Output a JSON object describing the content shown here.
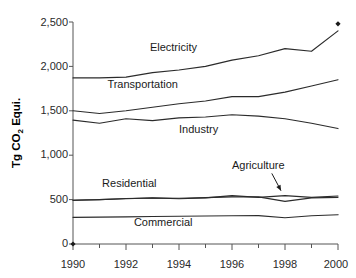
{
  "chart_data": {
    "type": "line",
    "title": "",
    "subtitle": "",
    "xlabel": "",
    "ylabel": "Tg CO2 Equi.",
    "ylabel_parts": {
      "pre": "Tg CO",
      "sub": "2",
      "post": " Equi."
    },
    "xlim": [
      1990,
      2000
    ],
    "ylim": [
      0,
      2500
    ],
    "grid": false,
    "legend_position": "inline-labels",
    "y_ticks": [
      0,
      500,
      1000,
      1500,
      2000,
      2500
    ],
    "y_tick_labels": [
      "0",
      "500",
      "1,000",
      "1,500",
      "2,000",
      "2,500"
    ],
    "x_ticks": [
      1990,
      1992,
      1994,
      1996,
      1998,
      2000
    ],
    "x_tick_labels": [
      "1990",
      "1992",
      "1994",
      "1996",
      "1998",
      "2000"
    ],
    "x_minor_ticks": [
      1991,
      1993,
      1995,
      1997,
      1999
    ],
    "x": [
      1990,
      1991,
      1992,
      1993,
      1994,
      1995,
      1996,
      1997,
      1998,
      1999,
      2000
    ],
    "series": [
      {
        "name": "Electricity",
        "label": "Electricity",
        "values": [
          1870,
          1870,
          1880,
          1930,
          1960,
          2000,
          2070,
          2120,
          2200,
          2170,
          2400
        ],
        "label_x": 1992.9,
        "label_y": 2170
      },
      {
        "name": "Transportation",
        "label": "Transportation",
        "values": [
          1500,
          1470,
          1500,
          1540,
          1580,
          1610,
          1660,
          1660,
          1710,
          1780,
          1850
        ],
        "label_x": 1991.3,
        "label_y": 1760
      },
      {
        "name": "Industry",
        "label": "Industry",
        "values": [
          1395,
          1360,
          1410,
          1390,
          1420,
          1430,
          1455,
          1440,
          1410,
          1360,
          1300
        ],
        "label_x": 1994.0,
        "label_y": 1255
      },
      {
        "name": "Residential",
        "label": "Residential",
        "values": [
          490,
          500,
          510,
          520,
          510,
          520,
          545,
          525,
          545,
          525,
          540
        ],
        "label_x": 1991.1,
        "label_y": 640
      },
      {
        "name": "Agriculture",
        "label": "Agriculture",
        "values": [
          495,
          500,
          512,
          518,
          515,
          522,
          530,
          530,
          480,
          520,
          525
        ],
        "label_x": 1996.5,
        "label_y": 790
      },
      {
        "name": "Commercial",
        "label": "Commercial",
        "values": [
          300,
          303,
          306,
          310,
          312,
          315,
          318,
          320,
          295,
          318,
          330
        ],
        "label_x": 1992.3,
        "label_y": 200
      }
    ],
    "annotations": [
      {
        "name": "agriculture-callout",
        "text": "Agriculture",
        "target_x": 1998.0,
        "target_y": 600,
        "arrow_from_x": 1997.5,
        "arrow_from_y": 730
      }
    ],
    "markers": [
      {
        "name": "top-right-diamond",
        "x": 2000,
        "y": 2480
      },
      {
        "name": "origin-diamond",
        "x": 1990,
        "y": 0
      }
    ]
  }
}
